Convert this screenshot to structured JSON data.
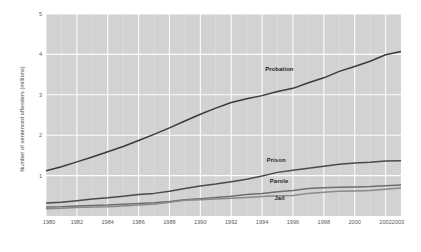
{
  "chart_data": {
    "type": "line",
    "title": "",
    "xlabel": "",
    "ylabel": "Number of sentenced offenders (millions)",
    "xlim": [
      1980,
      2003
    ],
    "ylim": [
      0,
      5
    ],
    "grid": true,
    "legend_position": "inline-labels",
    "x": [
      1980,
      1981,
      1982,
      1983,
      1984,
      1985,
      1986,
      1987,
      1988,
      1989,
      1990,
      1991,
      1992,
      1993,
      1994,
      1995,
      1996,
      1997,
      1998,
      1999,
      2000,
      2001,
      2002,
      2003
    ],
    "xticks": [
      "1980",
      "1982",
      "1984",
      "1986",
      "1988",
      "1990",
      "1992",
      "1994",
      "1996",
      "1998",
      "2000",
      "2002",
      "2003"
    ],
    "yticks": [
      "1",
      "2",
      "3",
      "4",
      "5"
    ],
    "series": [
      {
        "name": "Probation",
        "color": "#3a3a3a",
        "values": [
          1.12,
          1.22,
          1.34,
          1.46,
          1.59,
          1.72,
          1.87,
          2.02,
          2.18,
          2.35,
          2.52,
          2.67,
          2.81,
          2.9,
          2.98,
          3.08,
          3.16,
          3.3,
          3.42,
          3.58,
          3.7,
          3.83,
          3.99,
          4.07
        ]
      },
      {
        "name": "Prison",
        "color": "#4a4a4a",
        "values": [
          0.32,
          0.34,
          0.38,
          0.42,
          0.45,
          0.49,
          0.53,
          0.56,
          0.61,
          0.68,
          0.74,
          0.79,
          0.85,
          0.91,
          0.99,
          1.08,
          1.13,
          1.18,
          1.23,
          1.28,
          1.31,
          1.33,
          1.36,
          1.37
        ]
      },
      {
        "name": "Parole",
        "color": "#6e6e6e",
        "values": [
          0.22,
          0.23,
          0.25,
          0.26,
          0.27,
          0.29,
          0.31,
          0.33,
          0.36,
          0.4,
          0.43,
          0.46,
          0.49,
          0.53,
          0.56,
          0.6,
          0.63,
          0.68,
          0.7,
          0.71,
          0.72,
          0.73,
          0.75,
          0.77
        ]
      },
      {
        "name": "Jail",
        "color": "#8a8a8a",
        "values": [
          0.18,
          0.19,
          0.21,
          0.22,
          0.23,
          0.25,
          0.27,
          0.29,
          0.34,
          0.39,
          0.4,
          0.42,
          0.44,
          0.46,
          0.48,
          0.5,
          0.51,
          0.56,
          0.59,
          0.61,
          0.62,
          0.63,
          0.66,
          0.69
        ]
      }
    ],
    "series_label_positions": [
      {
        "name": "Probation",
        "x": 1994.2,
        "y": 3.72
      },
      {
        "name": "Prison",
        "x": 1994.3,
        "y": 1.47
      },
      {
        "name": "Parole",
        "x": 1994.5,
        "y": 0.93
      },
      {
        "name": "Jail",
        "x": 1994.8,
        "y": 0.52
      }
    ]
  }
}
